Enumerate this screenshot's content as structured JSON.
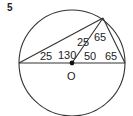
{
  "problem": {
    "number": "5"
  },
  "figure": {
    "colors": {
      "stroke": "#333333",
      "text": "#222222",
      "background": "#ffffff"
    },
    "circle": {
      "center_label": "O"
    },
    "angle_labels": {
      "left_vertex": "25",
      "top_left_angle": "25",
      "central_left": "130",
      "top_right_angle": "65",
      "central_right": "50",
      "right_vertex": "65"
    }
  }
}
